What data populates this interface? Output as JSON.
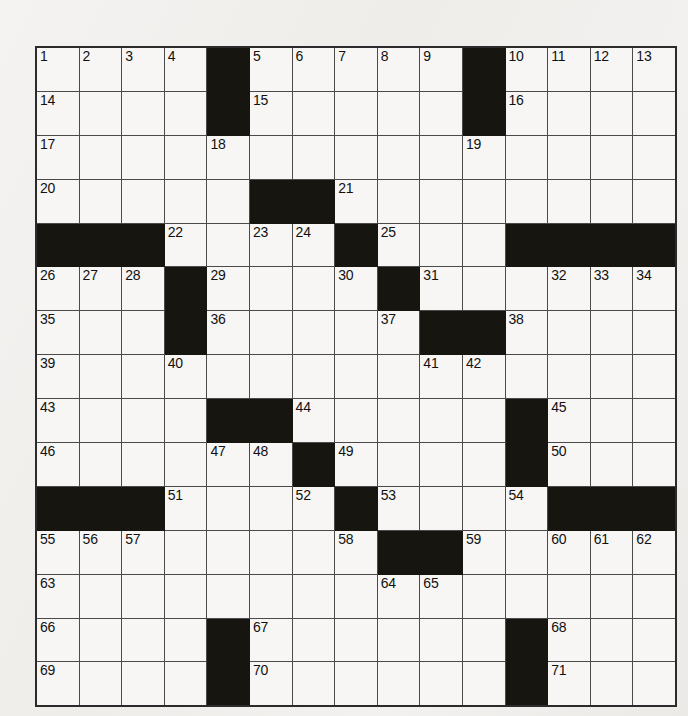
{
  "puzzle": {
    "title": "Crossword Puzzle Grid",
    "rows": 15,
    "cols": 15,
    "cell_size_px": 41.6,
    "colors": {
      "paper": "#f1f0ee",
      "cell_fill": "#f7f6f4",
      "block_fill": "#17150f",
      "grid_line": "#4a4a4a",
      "border": "#2b2b2b",
      "number_text": "#111111"
    },
    "grid": [
      [
        {
          "t": "white",
          "n": "1"
        },
        {
          "t": "white",
          "n": "2"
        },
        {
          "t": "white",
          "n": "3"
        },
        {
          "t": "white",
          "n": "4"
        },
        {
          "t": "block",
          "n": ""
        },
        {
          "t": "white",
          "n": "5"
        },
        {
          "t": "white",
          "n": "6"
        },
        {
          "t": "white",
          "n": "7"
        },
        {
          "t": "white",
          "n": "8"
        },
        {
          "t": "white",
          "n": "9"
        },
        {
          "t": "block",
          "n": ""
        },
        {
          "t": "white",
          "n": "10"
        },
        {
          "t": "white",
          "n": "11"
        },
        {
          "t": "white",
          "n": "12"
        },
        {
          "t": "white",
          "n": "13"
        }
      ],
      [
        {
          "t": "white",
          "n": "14"
        },
        {
          "t": "white",
          "n": ""
        },
        {
          "t": "white",
          "n": ""
        },
        {
          "t": "white",
          "n": ""
        },
        {
          "t": "block",
          "n": ""
        },
        {
          "t": "white",
          "n": "15"
        },
        {
          "t": "white",
          "n": ""
        },
        {
          "t": "white",
          "n": ""
        },
        {
          "t": "white",
          "n": ""
        },
        {
          "t": "white",
          "n": ""
        },
        {
          "t": "block",
          "n": ""
        },
        {
          "t": "white",
          "n": "16"
        },
        {
          "t": "white",
          "n": ""
        },
        {
          "t": "white",
          "n": ""
        },
        {
          "t": "white",
          "n": ""
        }
      ],
      [
        {
          "t": "white",
          "n": "17"
        },
        {
          "t": "white",
          "n": ""
        },
        {
          "t": "white",
          "n": ""
        },
        {
          "t": "white",
          "n": ""
        },
        {
          "t": "white",
          "n": "18"
        },
        {
          "t": "white",
          "n": ""
        },
        {
          "t": "white",
          "n": ""
        },
        {
          "t": "white",
          "n": ""
        },
        {
          "t": "white",
          "n": ""
        },
        {
          "t": "white",
          "n": ""
        },
        {
          "t": "white",
          "n": "19"
        },
        {
          "t": "white",
          "n": ""
        },
        {
          "t": "white",
          "n": ""
        },
        {
          "t": "white",
          "n": ""
        },
        {
          "t": "white",
          "n": ""
        }
      ],
      [
        {
          "t": "white",
          "n": "20"
        },
        {
          "t": "white",
          "n": ""
        },
        {
          "t": "white",
          "n": ""
        },
        {
          "t": "white",
          "n": ""
        },
        {
          "t": "white",
          "n": ""
        },
        {
          "t": "block",
          "n": ""
        },
        {
          "t": "block",
          "n": ""
        },
        {
          "t": "white",
          "n": "21"
        },
        {
          "t": "white",
          "n": ""
        },
        {
          "t": "white",
          "n": ""
        },
        {
          "t": "white",
          "n": ""
        },
        {
          "t": "white",
          "n": ""
        },
        {
          "t": "white",
          "n": ""
        },
        {
          "t": "white",
          "n": ""
        },
        {
          "t": "white",
          "n": ""
        }
      ],
      [
        {
          "t": "block",
          "n": ""
        },
        {
          "t": "block",
          "n": ""
        },
        {
          "t": "block",
          "n": ""
        },
        {
          "t": "white",
          "n": "22"
        },
        {
          "t": "white",
          "n": ""
        },
        {
          "t": "white",
          "n": "23"
        },
        {
          "t": "white",
          "n": "24"
        },
        {
          "t": "block",
          "n": ""
        },
        {
          "t": "white",
          "n": "25"
        },
        {
          "t": "white",
          "n": ""
        },
        {
          "t": "white",
          "n": ""
        },
        {
          "t": "block",
          "n": ""
        },
        {
          "t": "block",
          "n": ""
        },
        {
          "t": "block",
          "n": ""
        },
        {
          "t": "block",
          "n": ""
        }
      ],
      [
        {
          "t": "white",
          "n": "26"
        },
        {
          "t": "white",
          "n": "27"
        },
        {
          "t": "white",
          "n": "28"
        },
        {
          "t": "block",
          "n": ""
        },
        {
          "t": "white",
          "n": "29"
        },
        {
          "t": "white",
          "n": ""
        },
        {
          "t": "white",
          "n": ""
        },
        {
          "t": "white",
          "n": "30"
        },
        {
          "t": "block",
          "n": ""
        },
        {
          "t": "white",
          "n": "31"
        },
        {
          "t": "white",
          "n": ""
        },
        {
          "t": "white",
          "n": ""
        },
        {
          "t": "white",
          "n": "32"
        },
        {
          "t": "white",
          "n": "33"
        },
        {
          "t": "white",
          "n": "34"
        }
      ],
      [
        {
          "t": "white",
          "n": "35"
        },
        {
          "t": "white",
          "n": ""
        },
        {
          "t": "white",
          "n": ""
        },
        {
          "t": "block",
          "n": ""
        },
        {
          "t": "white",
          "n": "36"
        },
        {
          "t": "white",
          "n": ""
        },
        {
          "t": "white",
          "n": ""
        },
        {
          "t": "white",
          "n": ""
        },
        {
          "t": "white",
          "n": "37"
        },
        {
          "t": "block",
          "n": ""
        },
        {
          "t": "block",
          "n": ""
        },
        {
          "t": "white",
          "n": "38"
        },
        {
          "t": "white",
          "n": ""
        },
        {
          "t": "white",
          "n": ""
        },
        {
          "t": "white",
          "n": ""
        }
      ],
      [
        {
          "t": "white",
          "n": "39"
        },
        {
          "t": "white",
          "n": ""
        },
        {
          "t": "white",
          "n": ""
        },
        {
          "t": "white",
          "n": "40"
        },
        {
          "t": "white",
          "n": ""
        },
        {
          "t": "white",
          "n": ""
        },
        {
          "t": "white",
          "n": ""
        },
        {
          "t": "white",
          "n": ""
        },
        {
          "t": "white",
          "n": ""
        },
        {
          "t": "white",
          "n": "41"
        },
        {
          "t": "white",
          "n": "42"
        },
        {
          "t": "white",
          "n": ""
        },
        {
          "t": "white",
          "n": ""
        },
        {
          "t": "white",
          "n": ""
        },
        {
          "t": "white",
          "n": ""
        }
      ],
      [
        {
          "t": "white",
          "n": "43"
        },
        {
          "t": "white",
          "n": ""
        },
        {
          "t": "white",
          "n": ""
        },
        {
          "t": "white",
          "n": ""
        },
        {
          "t": "block",
          "n": ""
        },
        {
          "t": "block",
          "n": ""
        },
        {
          "t": "white",
          "n": "44"
        },
        {
          "t": "white",
          "n": ""
        },
        {
          "t": "white",
          "n": ""
        },
        {
          "t": "white",
          "n": ""
        },
        {
          "t": "white",
          "n": ""
        },
        {
          "t": "block",
          "n": ""
        },
        {
          "t": "white",
          "n": "45"
        },
        {
          "t": "white",
          "n": ""
        },
        {
          "t": "white",
          "n": ""
        }
      ],
      [
        {
          "t": "white",
          "n": "46"
        },
        {
          "t": "white",
          "n": ""
        },
        {
          "t": "white",
          "n": ""
        },
        {
          "t": "white",
          "n": ""
        },
        {
          "t": "white",
          "n": "47"
        },
        {
          "t": "white",
          "n": "48"
        },
        {
          "t": "block",
          "n": ""
        },
        {
          "t": "white",
          "n": "49"
        },
        {
          "t": "white",
          "n": ""
        },
        {
          "t": "white",
          "n": ""
        },
        {
          "t": "white",
          "n": ""
        },
        {
          "t": "block",
          "n": ""
        },
        {
          "t": "white",
          "n": "50"
        },
        {
          "t": "white",
          "n": ""
        },
        {
          "t": "white",
          "n": ""
        }
      ],
      [
        {
          "t": "block",
          "n": ""
        },
        {
          "t": "block",
          "n": ""
        },
        {
          "t": "block",
          "n": ""
        },
        {
          "t": "white",
          "n": "51"
        },
        {
          "t": "white",
          "n": ""
        },
        {
          "t": "white",
          "n": ""
        },
        {
          "t": "white",
          "n": "52"
        },
        {
          "t": "block",
          "n": ""
        },
        {
          "t": "white",
          "n": "53"
        },
        {
          "t": "white",
          "n": ""
        },
        {
          "t": "white",
          "n": ""
        },
        {
          "t": "white",
          "n": "54"
        },
        {
          "t": "block",
          "n": ""
        },
        {
          "t": "block",
          "n": ""
        },
        {
          "t": "block",
          "n": ""
        }
      ],
      [
        {
          "t": "white",
          "n": "55"
        },
        {
          "t": "white",
          "n": "56"
        },
        {
          "t": "white",
          "n": "57"
        },
        {
          "t": "white",
          "n": ""
        },
        {
          "t": "white",
          "n": ""
        },
        {
          "t": "white",
          "n": ""
        },
        {
          "t": "white",
          "n": ""
        },
        {
          "t": "white",
          "n": "58"
        },
        {
          "t": "block",
          "n": ""
        },
        {
          "t": "block",
          "n": ""
        },
        {
          "t": "white",
          "n": "59"
        },
        {
          "t": "white",
          "n": ""
        },
        {
          "t": "white",
          "n": "60"
        },
        {
          "t": "white",
          "n": "61"
        },
        {
          "t": "white",
          "n": "62"
        }
      ],
      [
        {
          "t": "white",
          "n": "63"
        },
        {
          "t": "white",
          "n": ""
        },
        {
          "t": "white",
          "n": ""
        },
        {
          "t": "white",
          "n": ""
        },
        {
          "t": "white",
          "n": ""
        },
        {
          "t": "white",
          "n": ""
        },
        {
          "t": "white",
          "n": ""
        },
        {
          "t": "white",
          "n": ""
        },
        {
          "t": "white",
          "n": "64"
        },
        {
          "t": "white",
          "n": "65"
        },
        {
          "t": "white",
          "n": ""
        },
        {
          "t": "white",
          "n": ""
        },
        {
          "t": "white",
          "n": ""
        },
        {
          "t": "white",
          "n": ""
        },
        {
          "t": "white",
          "n": ""
        }
      ],
      [
        {
          "t": "white",
          "n": "66"
        },
        {
          "t": "white",
          "n": ""
        },
        {
          "t": "white",
          "n": ""
        },
        {
          "t": "white",
          "n": ""
        },
        {
          "t": "block",
          "n": ""
        },
        {
          "t": "white",
          "n": "67"
        },
        {
          "t": "white",
          "n": ""
        },
        {
          "t": "white",
          "n": ""
        },
        {
          "t": "white",
          "n": ""
        },
        {
          "t": "white",
          "n": ""
        },
        {
          "t": "white",
          "n": ""
        },
        {
          "t": "block",
          "n": ""
        },
        {
          "t": "white",
          "n": "68"
        },
        {
          "t": "white",
          "n": ""
        },
        {
          "t": "white",
          "n": ""
        }
      ],
      [
        {
          "t": "white",
          "n": "69"
        },
        {
          "t": "white",
          "n": ""
        },
        {
          "t": "white",
          "n": ""
        },
        {
          "t": "white",
          "n": ""
        },
        {
          "t": "block",
          "n": ""
        },
        {
          "t": "white",
          "n": "70"
        },
        {
          "t": "white",
          "n": ""
        },
        {
          "t": "white",
          "n": ""
        },
        {
          "t": "white",
          "n": ""
        },
        {
          "t": "white",
          "n": ""
        },
        {
          "t": "white",
          "n": ""
        },
        {
          "t": "block",
          "n": ""
        },
        {
          "t": "white",
          "n": "71"
        },
        {
          "t": "white",
          "n": ""
        },
        {
          "t": "white",
          "n": ""
        }
      ]
    ]
  }
}
